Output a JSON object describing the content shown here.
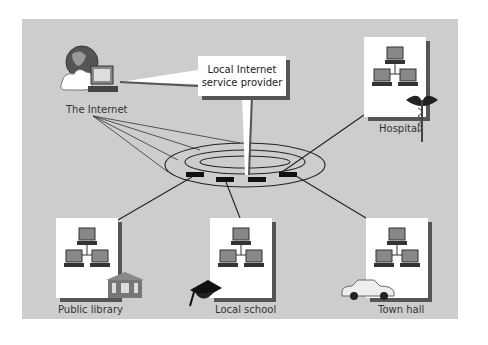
{
  "diagram": {
    "callout": {
      "line1": "Local Internet",
      "line2": "service provider"
    },
    "nodes": [
      {
        "id": "internet",
        "label": "The Internet"
      },
      {
        "id": "hospital",
        "label": "Hospital"
      },
      {
        "id": "library",
        "label": "Public library"
      },
      {
        "id": "school",
        "label": "Local school"
      },
      {
        "id": "townhall",
        "label": "Town hall"
      }
    ],
    "colors": {
      "background": "#cdcdcd",
      "box": "#ffffff",
      "shadow": "#555555",
      "line": "#222222"
    }
  }
}
